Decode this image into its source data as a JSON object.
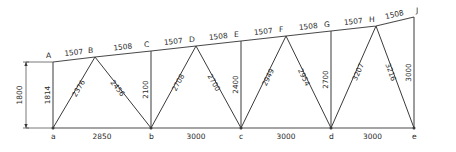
{
  "figure": {
    "units_note": "",
    "line_color": "#3a3a3a",
    "text_color": "#2b2b2b",
    "background": "#ffffff"
  },
  "top_chord": {
    "nodes": [
      {
        "id": "A",
        "label": "A",
        "x": 53,
        "y": 62
      },
      {
        "id": "B",
        "label": "B",
        "x": 95,
        "y": 57
      },
      {
        "id": "C",
        "label": "C",
        "x": 151,
        "y": 51
      },
      {
        "id": "D",
        "label": "D",
        "x": 196,
        "y": 46
      },
      {
        "id": "E",
        "label": "E",
        "x": 241,
        "y": 41
      },
      {
        "id": "F",
        "label": "F",
        "x": 286,
        "y": 36
      },
      {
        "id": "G",
        "label": "G",
        "x": 331,
        "y": 31
      },
      {
        "id": "H",
        "label": "H",
        "x": 376,
        "y": 26
      },
      {
        "id": "J",
        "label": "J",
        "x": 414,
        "y": 17
      }
    ],
    "segments": [
      {
        "from": "A",
        "to": "B",
        "length": "1507"
      },
      {
        "from": "B",
        "to": "C",
        "length": "1508"
      },
      {
        "from": "C",
        "to": "D",
        "length": "1507"
      },
      {
        "from": "D",
        "to": "E",
        "length": "1508"
      },
      {
        "from": "E",
        "to": "F",
        "length": "1507"
      },
      {
        "from": "F",
        "to": "G",
        "length": "1508"
      },
      {
        "from": "G",
        "to": "H",
        "length": "1507"
      },
      {
        "from": "H",
        "to": "J",
        "length": "1508"
      }
    ]
  },
  "bottom_chord": {
    "nodes": [
      {
        "id": "a",
        "label": "a",
        "x": 53,
        "y": 128
      },
      {
        "id": "b",
        "label": "b",
        "x": 151,
        "y": 128
      },
      {
        "id": "c",
        "label": "c",
        "x": 241,
        "y": 128
      },
      {
        "id": "d",
        "label": "d",
        "x": 331,
        "y": 128
      },
      {
        "id": "e",
        "label": "e",
        "x": 414,
        "y": 128
      }
    ],
    "segments": [
      {
        "from": "a",
        "to": "b",
        "length": "2850"
      },
      {
        "from": "b",
        "to": "c",
        "length": "3000"
      },
      {
        "from": "c",
        "to": "d",
        "length": "3000"
      },
      {
        "from": "d",
        "to": "e",
        "length": "3000"
      }
    ]
  },
  "verticals": [
    {
      "top": "A",
      "bottom": "a",
      "length": "1814"
    },
    {
      "top": "C",
      "bottom": "b",
      "length": "2100"
    },
    {
      "top": "E",
      "bottom": "c",
      "length": "2400"
    },
    {
      "top": "G",
      "bottom": "d",
      "length": "2700"
    },
    {
      "top": "J",
      "bottom": "e",
      "length": "3000"
    }
  ],
  "diagonals": [
    {
      "top": "B",
      "bottom": "a",
      "length": "2376"
    },
    {
      "top": "B",
      "bottom": "b",
      "length": "2456"
    },
    {
      "top": "D",
      "bottom": "b",
      "length": "2708"
    },
    {
      "top": "D",
      "bottom": "c",
      "length": "2700"
    },
    {
      "top": "F",
      "bottom": "c",
      "length": "2949"
    },
    {
      "top": "F",
      "bottom": "d",
      "length": "2954"
    },
    {
      "top": "H",
      "bottom": "d",
      "length": "3207"
    },
    {
      "top": "H",
      "bottom": "e",
      "length": "3216"
    }
  ],
  "overall_dimension": {
    "label": "1800",
    "x": 26,
    "y_top": 62,
    "y_bottom": 128
  }
}
